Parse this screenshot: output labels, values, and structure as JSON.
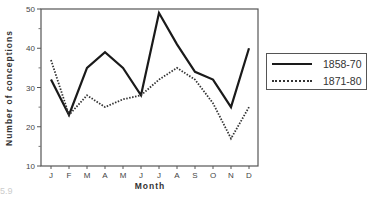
{
  "chart_data": {
    "type": "line",
    "title": "",
    "xlabel": "Month",
    "ylabel": "Number of conceptions",
    "categories": [
      "J",
      "F",
      "M",
      "A",
      "M",
      "J",
      "J",
      "A",
      "S",
      "O",
      "N",
      "D"
    ],
    "series": [
      {
        "name": "1858-70",
        "style": "solid",
        "values": [
          32,
          23,
          35,
          39,
          35,
          28,
          49,
          41,
          34,
          32,
          25,
          40
        ]
      },
      {
        "name": "1871-80",
        "style": "dotted",
        "values": [
          37,
          23,
          28,
          25,
          27,
          28,
          32,
          35,
          32,
          26,
          17,
          25
        ]
      }
    ],
    "ylim": [
      10,
      50
    ],
    "yticks": [
      10,
      20,
      30,
      40,
      50
    ],
    "grid": false,
    "legend_position": "right"
  },
  "legend": {
    "items": [
      {
        "label": "1858-70",
        "style": "solid"
      },
      {
        "label": "1871-80",
        "style": "dotted"
      }
    ]
  },
  "caption": {
    "text": "5.9"
  }
}
